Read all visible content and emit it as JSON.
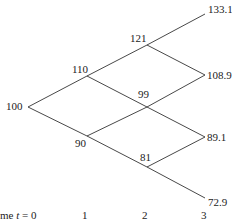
{
  "diagram": {
    "type": "binomial-tree",
    "nodes": {
      "n0": "100",
      "n1u": "110",
      "n1d": "90",
      "n2uu": "121",
      "n2ud": "99",
      "n2dd": "81",
      "n3uuu": "133.1",
      "n3uud": "108.9",
      "n3udd": "89.1",
      "n3ddd": "72.9"
    },
    "axis": {
      "prefix": "me ",
      "t_var": "t",
      "t0_suffix": " = 0",
      "t1": "1",
      "t2": "2",
      "t3": "3"
    },
    "line_color": "#333333"
  }
}
